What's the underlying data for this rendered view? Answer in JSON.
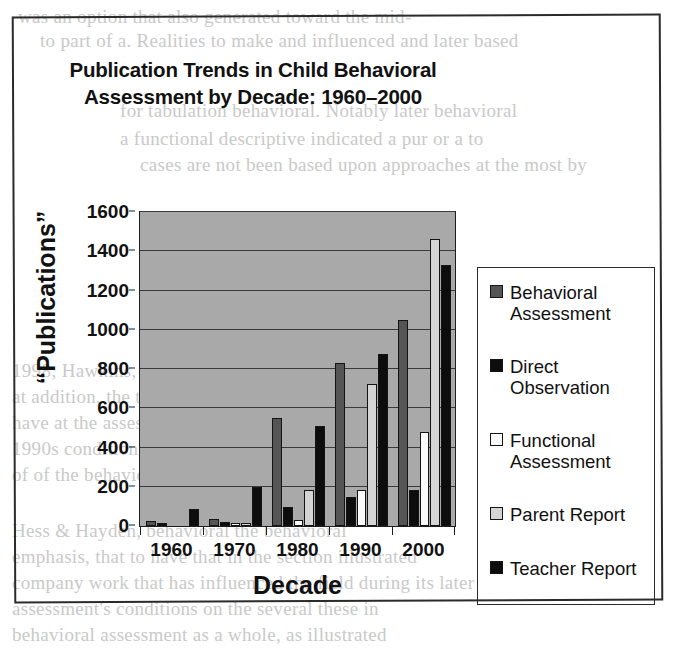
{
  "figure": {
    "title_line1": "Publication Trends in Child Behavioral",
    "title_line2": "Assessment by Decade: 1960–2000"
  },
  "bleed_text": {
    "l1": "was an option that also generated toward the mid-",
    "l2": "to part of a. Realities to make and influenced and later based",
    "l3": "for tabulation behavioral. Notably later behavioral",
    "l4": "a functional descriptive indicated a pur or a to",
    "l5": "cases are not been based upon approaches at the most by",
    "l6": "1998; Hawkins, 1988).",
    "l7": "at addition, the trend was to assessments",
    "l8": "have at the assessment assessment of all 1980",
    "l9": "1990s conditions and in the problem most cases such",
    "l10": "of of the behavioral treatment for these conditions",
    "l11": "Hess & Hayden, behavioral the behavioral",
    "l12": "emphasis, that to have that in the section illustrated",
    "l13": "company work that has influenced the field during its later",
    "l14": "assessment's conditions on the several these in",
    "l15": "behavioral assessment as a whole, as illustrated"
  },
  "chart_data": {
    "type": "bar",
    "title": "Publication Trends in Child Behavioral Assessment by Decade: 1960–2000",
    "xlabel": "Decade",
    "ylabel": "“Publications”",
    "categories": [
      "1960",
      "1970",
      "1980",
      "1990",
      "2000"
    ],
    "ylim": [
      0,
      1600
    ],
    "yticks": [
      0,
      200,
      400,
      600,
      800,
      1000,
      1200,
      1400,
      1600
    ],
    "grid": true,
    "legend_position": "right",
    "plot_background": "#a9a9a9",
    "series": [
      {
        "name": "Behavioral Assessment",
        "color": "#555555",
        "values": [
          25,
          35,
          550,
          830,
          1050
        ]
      },
      {
        "name": "Direct Observation",
        "color": "#0d0d0d",
        "values": [
          5,
          20,
          95,
          150,
          185
        ]
      },
      {
        "name": "Functional Assessment",
        "color": "#fcfcfc",
        "values": [
          0,
          10,
          30,
          185,
          480
        ]
      },
      {
        "name": "Parent Report",
        "color": "#d4d4d4",
        "values": [
          0,
          15,
          185,
          725,
          1465
        ]
      },
      {
        "name": "Teacher Report",
        "color": "#0d0d0d",
        "values": [
          85,
          200,
          510,
          875,
          1330
        ]
      }
    ]
  }
}
